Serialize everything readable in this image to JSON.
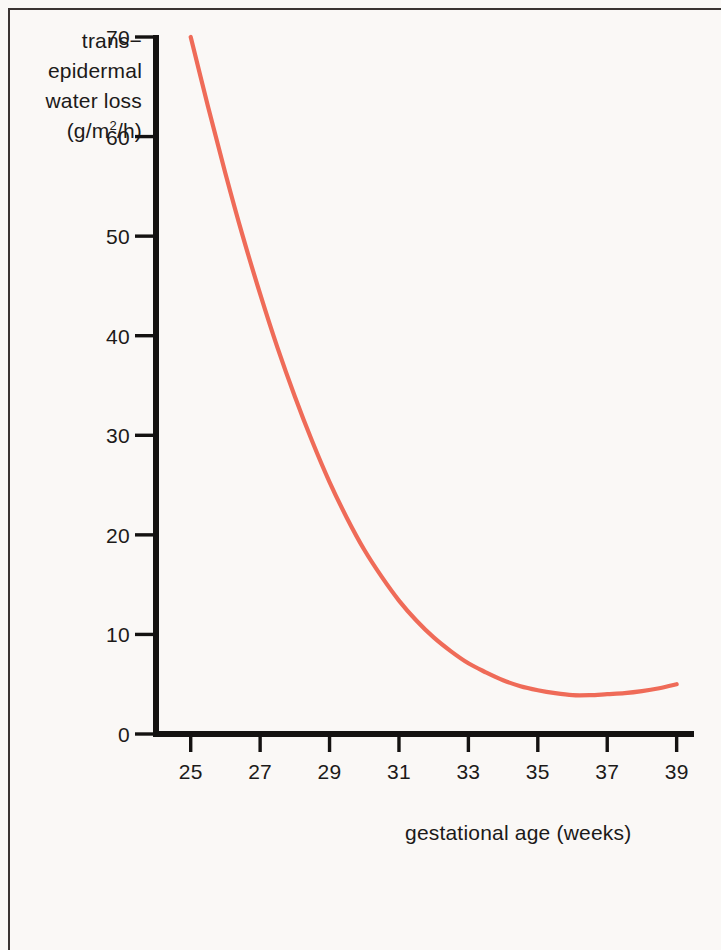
{
  "figure": {
    "background_color": "#faf8f6",
    "axis_color": "#141211",
    "curve_color": "#ef6b58",
    "border_color": "#3a3432"
  },
  "chart_data": {
    "type": "line",
    "title": "",
    "subtitle": "",
    "xlabel": "gestational age (weeks)",
    "ylabel": "trans−epidermal water loss (g/m2/h)",
    "ylabel_lines": [
      "trans−",
      "epidermal",
      "water loss",
      "(g/m",
      "2",
      "/h)"
    ],
    "xlim": [
      24,
      39.5
    ],
    "ylim": [
      0,
      70
    ],
    "xticks": [
      25,
      27,
      29,
      31,
      33,
      35,
      37,
      39
    ],
    "xtick_labels": [
      "25",
      "27",
      "29",
      "31",
      "33",
      "35",
      "37",
      "39"
    ],
    "yticks": [
      0,
      10,
      20,
      30,
      40,
      50,
      60,
      70
    ],
    "ytick_labels": [
      "0",
      "10",
      "20",
      "30",
      "40",
      "50",
      "60",
      "70"
    ],
    "grid": false,
    "legend": null,
    "legend_position": "none",
    "series": [
      {
        "name": "transepidermal water loss",
        "color": "#ef6b58",
        "x": [
          25.0,
          25.5,
          26.0,
          26.5,
          27.0,
          27.5,
          28.0,
          28.5,
          29.0,
          29.5,
          30.0,
          30.5,
          31.0,
          31.5,
          32.0,
          32.5,
          33.0,
          33.5,
          34.0,
          34.5,
          35.0,
          35.5,
          36.0,
          36.5,
          37.0,
          37.5,
          38.0,
          38.5,
          39.0
        ],
        "y": [
          70.0,
          63.0,
          56.3,
          50.0,
          44.2,
          38.8,
          33.9,
          29.4,
          25.3,
          21.7,
          18.5,
          15.8,
          13.4,
          11.4,
          9.7,
          8.3,
          7.1,
          6.2,
          5.4,
          4.8,
          4.4,
          4.1,
          3.9,
          3.9,
          4.0,
          4.1,
          4.3,
          4.6,
          5.0
        ]
      }
    ]
  }
}
